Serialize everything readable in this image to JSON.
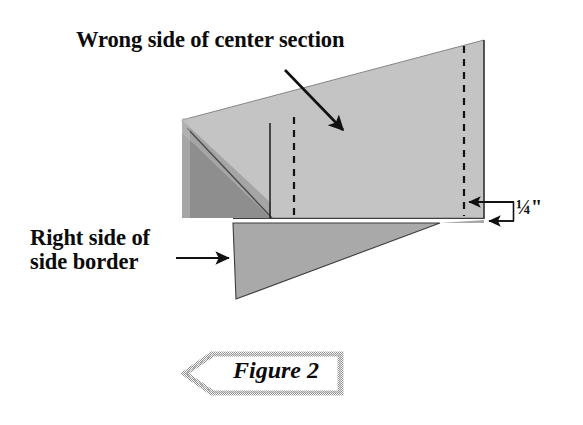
{
  "figure": {
    "caption": "Figure 2",
    "caption_banner_shape": "left-pointing-pentagon",
    "background_color": "#ffffff",
    "labels": {
      "wrong_side": "Wrong side of center section",
      "right_side_line1": "Right side of",
      "right_side_line2": "side border",
      "measurement": "¼\""
    },
    "colors": {
      "center_section_fill": "#c4c4c4",
      "side_border_fill": "#a8a8a8",
      "dark_fold_fill": "#8a8a8a",
      "outline": "#3a3a3a",
      "stroke": "#111111",
      "banner_border": "#9a9a9a",
      "banner_fill": "#ffffff",
      "text": "#0b0b0b"
    },
    "shapes": [
      {
        "name": "center-section-panel",
        "type": "quadrilateral",
        "fill": "#c4c4c4",
        "points": "182,120 484,40 484,218 233,218"
      },
      {
        "name": "dark-fold-triangle",
        "type": "triangle",
        "fill": "#8a8a8a",
        "points": "182,133 270,218 182,218"
      },
      {
        "name": "side-border-triangle",
        "type": "triangle",
        "fill": "#a8a8a8",
        "points": "233,224 440,224 236,299"
      }
    ],
    "lines": {
      "solid_vertical_seam_x": 270,
      "dashed_seam_left_x": 294,
      "dashed_seam_right_x": 464,
      "fold_diagonal": "187,128 272,217"
    },
    "arrows": [
      {
        "name": "wrong-side-arrow",
        "from": "285,70",
        "to": "347,134",
        "direction": "down-right"
      },
      {
        "name": "right-side-arrow",
        "from": "178,258",
        "to": "233,258",
        "direction": "right"
      },
      {
        "name": "quarter-inch-upper-arrow",
        "from": "512,202",
        "to": "466,202",
        "direction": "left"
      },
      {
        "name": "quarter-inch-lower-arrow",
        "from": "512,222",
        "to": "486,222",
        "direction": "left"
      }
    ]
  }
}
